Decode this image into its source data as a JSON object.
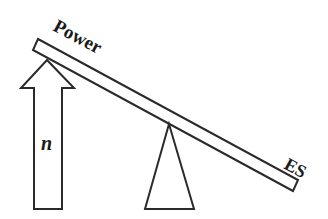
{
  "diagram": {
    "type": "seesaw-balance",
    "labels": {
      "high_end": "Power",
      "low_end": "ES",
      "arrow": "n"
    },
    "colors": {
      "stroke": "#2a2a2a",
      "fill": "#ffffff",
      "text": "#1a1a1a"
    }
  }
}
